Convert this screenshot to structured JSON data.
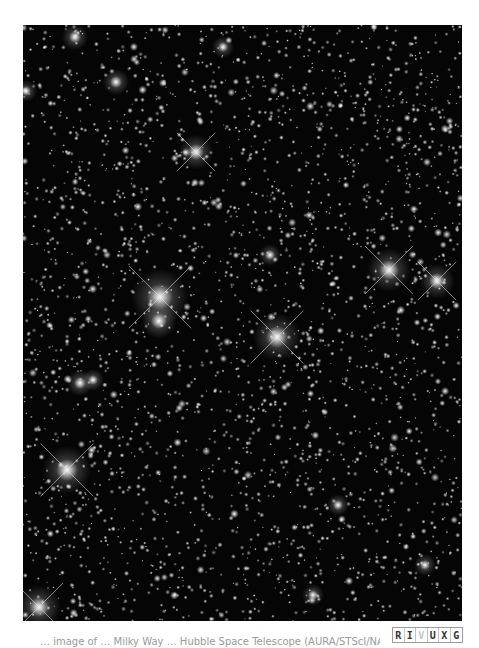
{
  "figure": {
    "background": "#050505",
    "star_field": {
      "seed": 20240613,
      "faint_star_count": 2600,
      "medium_star_count": 260,
      "width": 439,
      "height": 596
    },
    "bright_stars": [
      {
        "x": 137,
        "y": 272,
        "r": 13,
        "spikes": true
      },
      {
        "x": 136,
        "y": 296,
        "r": 8,
        "spikes": false
      },
      {
        "x": 254,
        "y": 312,
        "r": 11,
        "spikes": true
      },
      {
        "x": 44,
        "y": 445,
        "r": 11,
        "spikes": true
      },
      {
        "x": 366,
        "y": 245,
        "r": 10,
        "spikes": true
      },
      {
        "x": 414,
        "y": 256,
        "r": 8,
        "spikes": true
      },
      {
        "x": 173,
        "y": 127,
        "r": 8,
        "spikes": true
      },
      {
        "x": 16,
        "y": 582,
        "r": 10,
        "spikes": true
      },
      {
        "x": 52,
        "y": 12,
        "r": 6,
        "spikes": false
      },
      {
        "x": 93,
        "y": 57,
        "r": 6,
        "spikes": false
      },
      {
        "x": 57,
        "y": 358,
        "r": 6,
        "spikes": false
      },
      {
        "x": 70,
        "y": 355,
        "r": 5,
        "spikes": false
      },
      {
        "x": 3,
        "y": 66,
        "r": 5,
        "spikes": false
      },
      {
        "x": 200,
        "y": 22,
        "r": 5,
        "spikes": false
      },
      {
        "x": 247,
        "y": 230,
        "r": 5,
        "spikes": false
      },
      {
        "x": 315,
        "y": 480,
        "r": 5,
        "spikes": false
      },
      {
        "x": 402,
        "y": 540,
        "r": 5,
        "spikes": false
      },
      {
        "x": 290,
        "y": 570,
        "r": 5,
        "spikes": false
      }
    ]
  },
  "caption": {
    "text": "… image of … Milky Way … Hubble Space Telescope (AURA/STScI/NASA)"
  },
  "wavelength_badge": {
    "letters": [
      "R",
      "I",
      "V",
      "U",
      "X",
      "G"
    ],
    "active": "V"
  }
}
